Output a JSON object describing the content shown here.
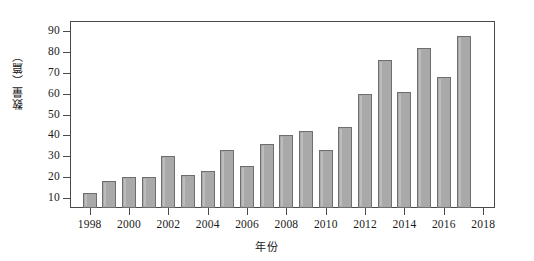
{
  "chart_data": {
    "type": "bar",
    "title": "",
    "subtitle": "",
    "xlabel": "年份",
    "ylabel": "数量（篇）",
    "categories": [
      1998,
      1999,
      2000,
      2001,
      2002,
      2003,
      2004,
      2005,
      2006,
      2007,
      2008,
      2009,
      2010,
      2011,
      2012,
      2013,
      2014,
      2015,
      2016,
      2017
    ],
    "values": [
      12,
      18,
      20,
      20,
      30,
      21,
      23,
      33,
      25,
      36,
      40,
      42,
      33,
      44,
      60,
      76,
      61,
      82,
      68,
      88
    ],
    "series": [
      {
        "name": "数量（篇）",
        "values": [
          12,
          18,
          20,
          20,
          30,
          21,
          23,
          33,
          25,
          36,
          40,
          42,
          33,
          44,
          60,
          76,
          61,
          82,
          68,
          88
        ]
      }
    ],
    "ylim": [
      5,
      95
    ],
    "xlim": [
      1997,
      2018.6
    ],
    "y_ticks": [
      10,
      20,
      30,
      40,
      50,
      60,
      70,
      80,
      90
    ],
    "y_tick_labels": [
      "10",
      "20",
      "30",
      "40",
      "50",
      "60",
      "70",
      "80",
      "90"
    ],
    "x_ticks": [
      1998,
      2000,
      2002,
      2004,
      2006,
      2008,
      2010,
      2012,
      2014,
      2016,
      2018
    ],
    "x_tick_labels": [
      "1998",
      "2000",
      "2002",
      "2004",
      "2006",
      "2008",
      "2010",
      "2012",
      "2014",
      "2016",
      "2018"
    ],
    "grid": false,
    "legend": false,
    "legend_position": "none",
    "bar_color": "#a9a9a9",
    "bar_edge_color": "#6e6e6e",
    "axis_color": "#4a4a4a",
    "background_color": "#ffffff"
  }
}
